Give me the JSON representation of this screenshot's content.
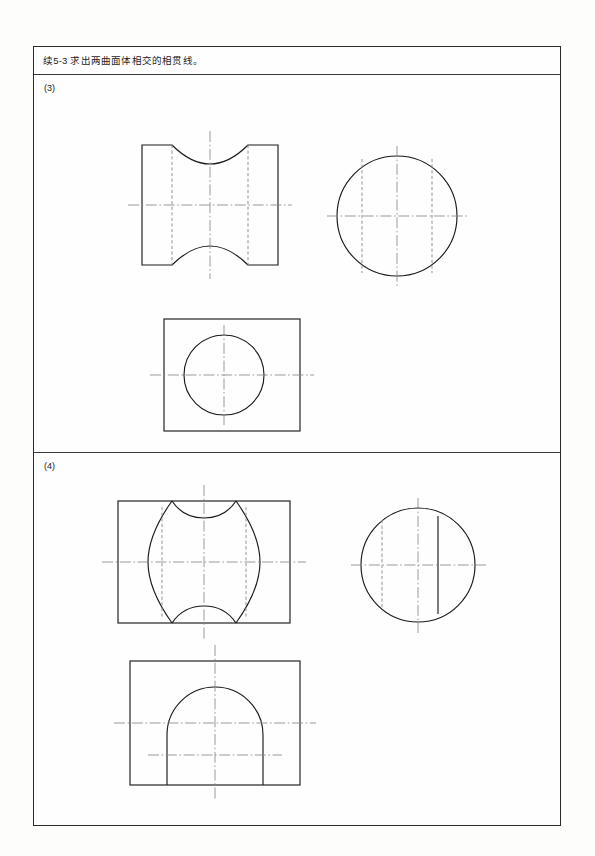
{
  "page": {
    "header_title": "续5-3  求出两曲面体相交的相贯线。",
    "ink_color": "#1a1a1a",
    "hidden_line_color": "#8d8d8d",
    "center_line_color": "#8a8a8a",
    "frame_color": "#2b2b2b",
    "background": "#fdfdfc"
  },
  "sections": [
    {
      "label": "(3)",
      "name": "exercise-3",
      "description": "两等直径圆柱正交，正面投影相贯线为向内凹的曲线",
      "views": [
        {
          "name": "front-view",
          "type": "rectangle-with-concave-arcs",
          "outline": {
            "x": 0,
            "y": 0,
            "width": 136,
            "height": 120
          },
          "arc_sagitta": 22,
          "hidden_lines_x": [
            30,
            106
          ],
          "center_h_y": 60,
          "center_v_x": 68
        },
        {
          "name": "side-view",
          "type": "circle",
          "circle": {
            "cx": 62,
            "cy": 62,
            "r": 60
          },
          "hidden_lines_x": [
            27,
            97
          ],
          "center_h_y": 62,
          "center_v_x": 62
        },
        {
          "name": "top-view",
          "type": "rectangle-with-circle",
          "outline": {
            "x": 0,
            "y": 0,
            "width": 136,
            "height": 112
          },
          "circle": {
            "cx": 60,
            "cy": 56,
            "r": 40
          },
          "center_h_y": 56,
          "center_v_x": 60
        }
      ]
    },
    {
      "label": "(4)",
      "name": "exercise-4",
      "description": "圆柱与圆柱偏交，正面投影相贯线为左右对称外凸曲线",
      "views": [
        {
          "name": "front-view",
          "type": "rectangle-with-astroid-curves",
          "outline": {
            "x": 0,
            "y": 0,
            "width": 172,
            "height": 122
          },
          "hidden_lines_x": [
            44,
            128
          ],
          "center_h_y": 61,
          "center_v_x": 86
        },
        {
          "name": "side-view",
          "type": "circle-with-two-verticals",
          "circle": {
            "cx": 58,
            "cy": 58,
            "r": 57
          },
          "hidden_line_x": 22,
          "solid_line_x": 78,
          "center_h_y": 58,
          "center_v_x": 58
        },
        {
          "name": "top-view",
          "type": "rectangle-with-open-arc",
          "outline": {
            "x": 0,
            "y": 0,
            "width": 170,
            "height": 124
          },
          "arc": {
            "cx": 85,
            "cy": 72,
            "r": 48
          },
          "center_h_y": 62,
          "center_v_x": 85,
          "lower_center_y": 94
        }
      ]
    }
  ]
}
